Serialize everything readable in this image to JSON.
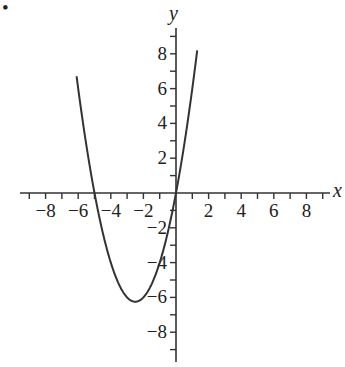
{
  "chart_data": {
    "type": "line",
    "title": "",
    "xlabel": "x",
    "ylabel": "y",
    "xlim": [
      -9.5,
      9.5
    ],
    "ylim": [
      -9.5,
      9.5
    ],
    "grid": false,
    "x_ticks": [
      -8,
      -6,
      -4,
      -2,
      2,
      4,
      6,
      8
    ],
    "y_ticks": [
      8,
      6,
      4,
      2,
      -2,
      -4,
      -6,
      -8
    ],
    "minor_tick_step": 1,
    "series": [
      {
        "name": "y = x^2 + 5x",
        "x": [
          -6.1,
          -6,
          -5.5,
          -5,
          -4.5,
          -4,
          -3.5,
          -3,
          -2.5,
          -2,
          -1.5,
          -1,
          -0.5,
          0,
          0.5,
          1,
          1.3
        ],
        "y": [
          6.71,
          6,
          2.75,
          0,
          -2.25,
          -4,
          -5.25,
          -6,
          -6.25,
          -6,
          -5.25,
          -4,
          -2.25,
          0,
          2.75,
          6,
          8.19
        ]
      }
    ],
    "annotations": [
      "•"
    ]
  },
  "labels": {
    "x_axis": "x",
    "y_axis": "y",
    "bullet": "•",
    "x_tick_labels": [
      "−8",
      "−6",
      "−4",
      "−2",
      "2",
      "4",
      "6",
      "8"
    ],
    "y_tick_labels": [
      "8",
      "6",
      "4",
      "2",
      "−2",
      "−4",
      "−6",
      "−8"
    ]
  }
}
